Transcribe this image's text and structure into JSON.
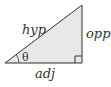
{
  "diagram": {
    "type": "right-triangle",
    "labels": {
      "hypotenuse": "hyp",
      "opposite": "opp",
      "adjacent": "adj",
      "angle": "θ"
    },
    "colors": {
      "fill": "#e6e6e6",
      "stroke": "#333333"
    }
  }
}
